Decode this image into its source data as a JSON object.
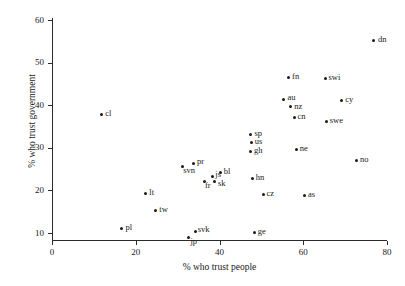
{
  "chart_data": {
    "type": "scatter",
    "title": "",
    "xlabel": "% who trust people",
    "ylabel": "% who trust government",
    "xlim": [
      0,
      80
    ],
    "ylim": [
      8,
      62
    ],
    "xticks": [
      0,
      20,
      40,
      60,
      80
    ],
    "yticks": [
      10,
      20,
      30,
      40,
      50,
      60
    ],
    "grid": false,
    "legend": "none",
    "marker": "filled-circle",
    "marker_color": "#1a1a1a",
    "axis_color": "#2b2b2b",
    "points": [
      {
        "label": "dn",
        "x": 76.8,
        "y": 55.3,
        "lx": 6,
        "ly": -4
      },
      {
        "label": "fn",
        "x": 56.5,
        "y": 46.4,
        "lx": 5,
        "ly": -4
      },
      {
        "label": "swi",
        "x": 65.2,
        "y": 46.2,
        "lx": 5,
        "ly": -4
      },
      {
        "label": "au",
        "x": 55.4,
        "y": 41.3,
        "lx": 5,
        "ly": -5
      },
      {
        "label": "nz",
        "x": 57.0,
        "y": 39.8,
        "lx": 5,
        "ly": -3
      },
      {
        "label": "cy",
        "x": 69.2,
        "y": 41.2,
        "lx": 5,
        "ly": -4
      },
      {
        "label": "cn",
        "x": 57.8,
        "y": 37.2,
        "lx": 5,
        "ly": -4
      },
      {
        "label": "swe",
        "x": 65.5,
        "y": 36.2,
        "lx": 5,
        "ly": -4
      },
      {
        "label": "cl",
        "x": 11.9,
        "y": 37.9,
        "lx": 5,
        "ly": -4
      },
      {
        "label": "sp",
        "x": 47.5,
        "y": 33.2,
        "lx": 5,
        "ly": -4
      },
      {
        "label": "us",
        "x": 47.6,
        "y": 31.2,
        "lx": 5,
        "ly": -4
      },
      {
        "label": "gh",
        "x": 47.4,
        "y": 29.2,
        "lx": 5,
        "ly": -4
      },
      {
        "label": "ne",
        "x": 58.3,
        "y": 29.6,
        "lx": 5,
        "ly": -4
      },
      {
        "label": "no",
        "x": 72.7,
        "y": 27.1,
        "lx": 5,
        "ly": -4
      },
      {
        "label": "pr",
        "x": 33.8,
        "y": 26.4,
        "lx": 5,
        "ly": -5
      },
      {
        "label": "svn",
        "x": 31.2,
        "y": 25.5,
        "lx": 2,
        "ly": 1
      },
      {
        "label": "js",
        "x": 38.4,
        "y": 23.3,
        "lx": 4,
        "ly": -5
      },
      {
        "label": "bl",
        "x": 40.2,
        "y": 24.2,
        "lx": 5,
        "ly": -4
      },
      {
        "label": "fr",
        "x": 36.4,
        "y": 22.0,
        "lx": 2,
        "ly": 1
      },
      {
        "label": "sk",
        "x": 38.8,
        "y": 22.0,
        "lx": 5,
        "ly": -1
      },
      {
        "label": "hn",
        "x": 47.8,
        "y": 22.9,
        "lx": 5,
        "ly": -4
      },
      {
        "label": "lt",
        "x": 22.4,
        "y": 19.3,
        "lx": 5,
        "ly": -4
      },
      {
        "label": "cz",
        "x": 50.4,
        "y": 19.0,
        "lx": 5,
        "ly": -4
      },
      {
        "label": "as",
        "x": 60.3,
        "y": 18.8,
        "lx": 5,
        "ly": -4
      },
      {
        "label": "tw",
        "x": 24.8,
        "y": 15.2,
        "lx": 5,
        "ly": -4
      },
      {
        "label": "pl",
        "x": 16.7,
        "y": 11.1,
        "lx": 5,
        "ly": -4
      },
      {
        "label": "svk",
        "x": 34.2,
        "y": 10.4,
        "lx": 4,
        "ly": -5
      },
      {
        "label": "jp",
        "x": 32.7,
        "y": 9.0,
        "lx": 3,
        "ly": 1
      },
      {
        "label": "ge",
        "x": 48.3,
        "y": 10.2,
        "lx": 5,
        "ly": -4
      }
    ]
  }
}
